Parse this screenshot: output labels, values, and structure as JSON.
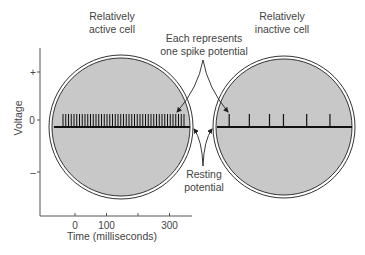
{
  "labels": {
    "active_cell": [
      "Relatively",
      "active cell"
    ],
    "inactive_cell": [
      "Relatively",
      "inactive cell"
    ],
    "spike_note": [
      "Each represents",
      "one spike potential"
    ],
    "resting_note": [
      "Resting",
      "potential"
    ]
  },
  "y_axis": {
    "title": "Voltage",
    "ticks": [
      "+",
      "0",
      "–"
    ]
  },
  "x_axis": {
    "title": "Time (milliseconds)",
    "ticks": [
      {
        "value": 0,
        "label": "0"
      },
      {
        "value": 100,
        "label": "100"
      },
      {
        "value": 200,
        "label": ""
      },
      {
        "value": 300,
        "label": "300"
      }
    ]
  },
  "colors": {
    "cell_fill": "#c8c8c8",
    "outline": "#333333",
    "trace": "#111111"
  },
  "cells": {
    "active": {
      "spike_count": 45,
      "pattern": "regular high-frequency"
    },
    "inactive": {
      "spike_count": 6,
      "pattern": "irregular low-frequency",
      "spike_times_ms": [
        20,
        85,
        150,
        195,
        270,
        345
      ]
    }
  }
}
